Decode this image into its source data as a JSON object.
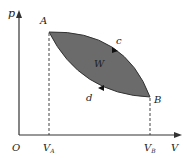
{
  "diagram": {
    "type": "p-V cycle diagram",
    "axes": {
      "y_label": "p",
      "x_label": "V",
      "origin_label": "O"
    },
    "points": {
      "A": {
        "label": "A",
        "volume_label": "V",
        "volume_sub": "A"
      },
      "B": {
        "label": "B",
        "volume_label": "V",
        "volume_sub": "B"
      }
    },
    "paths": {
      "upper": {
        "label": "c",
        "direction": "A to B"
      },
      "lower": {
        "label": "d",
        "direction": "B to A"
      }
    },
    "area_label": "W",
    "colors": {
      "fill": "#6b6b6b",
      "stroke": "#333333",
      "axis": "#333333",
      "text": "#222222"
    }
  }
}
